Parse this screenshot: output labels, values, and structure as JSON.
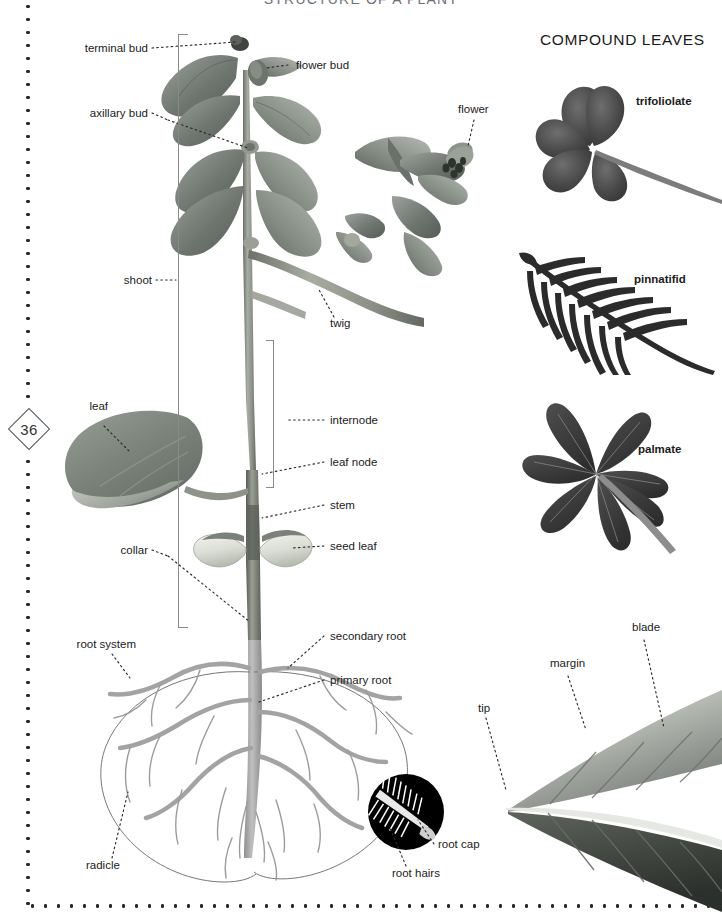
{
  "document": {
    "title": "STRUCTURE OF A PLANT",
    "page_number": "36"
  },
  "panels": {
    "compound_leaves_title": "COMPOUND LEAVES"
  },
  "plant_labels": {
    "terminal_bud": "terminal bud",
    "flower_bud": "flower bud",
    "axillary_bud": "axillary bud",
    "flower": "flower",
    "shoot": "shoot",
    "twig": "twig",
    "leaf": "leaf",
    "internode": "internode",
    "leaf_node": "leaf node",
    "stem": "stem",
    "collar": "collar",
    "seed_leaf": "seed leaf",
    "root_system": "root system",
    "secondary_root": "secondary root",
    "primary_root": "primary root",
    "radicle": "radicle",
    "root_cap": "root cap",
    "root_hairs": "root hairs"
  },
  "compound_leaf_types": [
    {
      "name": "trifoliolate",
      "leaflets": 3
    },
    {
      "name": "pinnatifid",
      "leaflets": 18
    },
    {
      "name": "palmate",
      "leaflets": 7
    }
  ],
  "leaf_detail_labels": {
    "tip": "tip",
    "margin": "margin",
    "blade": "blade"
  },
  "colors": {
    "background": "#ffffff",
    "text": "#1b1b1b",
    "title_text": "#6f6f7a",
    "leader_line": "#2b2b2b",
    "bracket": "#8a8a8a",
    "foliage_dark": "#595f5b",
    "foliage_mid": "#7e857f",
    "foliage_light": "#a7aea8",
    "stem": "#8d9389",
    "root": "#a8a8a8",
    "root_outline": "#6e6e6e",
    "seed_leaf": "#e4e6e0",
    "inset_background": "#000000",
    "compound_leaf": "#3a3a3a",
    "page_border": "#2b2b2b"
  }
}
